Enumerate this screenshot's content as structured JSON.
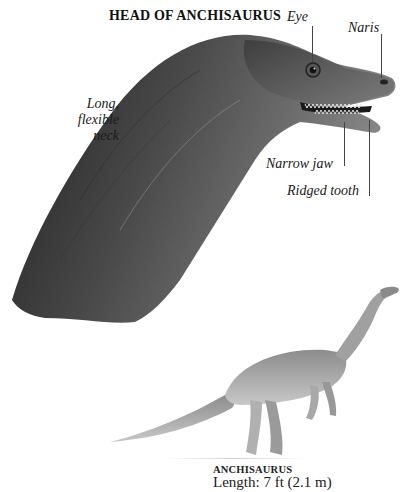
{
  "figure": {
    "title": "HEAD OF ANCHISAURUS",
    "labels": {
      "eye": "Eye",
      "naris": "Naris",
      "neck_line1": "Long,",
      "neck_line2": "flexible",
      "neck_line3": "neck",
      "jaw": "Narrow jaw",
      "tooth": "Ridged tooth"
    },
    "caption": {
      "name": "ANCHISAURUS",
      "length": "Length: 7 ft (2.1 m)"
    },
    "colors": {
      "background": "#ffffff",
      "skin_dark": "#2e2e2e",
      "skin_mid": "#6a6a6a",
      "skin_light": "#a8a8a8",
      "leader_line": "#444444"
    }
  }
}
